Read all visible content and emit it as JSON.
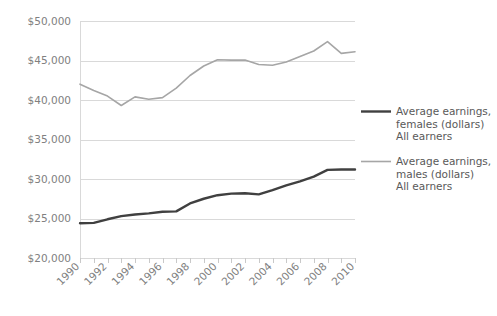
{
  "chart_data": {
    "type": "line",
    "title": "",
    "subtitle": "",
    "xlabel": "",
    "ylabel": "",
    "x": [
      1990,
      1991,
      1992,
      1993,
      1994,
      1995,
      1996,
      1997,
      1998,
      1999,
      2000,
      2001,
      2002,
      2003,
      2004,
      2005,
      2006,
      2007,
      2008,
      2009,
      2010
    ],
    "categories": [
      "1990",
      "1991",
      "1992",
      "1993",
      "1994",
      "1995",
      "1996",
      "1997",
      "1998",
      "1999",
      "2000",
      "2001",
      "2002",
      "2003",
      "2004",
      "2005",
      "2006",
      "2007",
      "2008",
      "2009",
      "2010"
    ],
    "xtick_labels": [
      "1990",
      "1992",
      "1994",
      "1996",
      "1998",
      "2000",
      "2002",
      "2004",
      "2006",
      "2008",
      "2010"
    ],
    "xtick_values": [
      1990,
      1992,
      1994,
      1996,
      1998,
      2000,
      2002,
      2004,
      2006,
      2008,
      2010
    ],
    "xlim": [
      1990,
      2010
    ],
    "ylim": [
      20000,
      50000
    ],
    "ytick_values": [
      20000,
      25000,
      30000,
      35000,
      40000,
      45000,
      50000
    ],
    "ytick_labels": [
      "$20,000",
      "$25,000",
      "$30,000",
      "$35,000",
      "$40,000",
      "$45,000",
      "$50,000"
    ],
    "grid": true,
    "legend_position": "right",
    "series": [
      {
        "name": "Average earnings, females (dollars) All earners",
        "legend_line1": "Average earnings,",
        "legend_line2": "females (dollars)",
        "legend_line3": "All earners",
        "color": "#404040",
        "width": 2.4,
        "values": [
          24400,
          24450,
          24900,
          25300,
          25500,
          25650,
          25850,
          25900,
          26900,
          27500,
          27950,
          28150,
          28200,
          28050,
          28600,
          29200,
          29700,
          30300,
          31150,
          31200,
          31200
        ]
      },
      {
        "name": "Average earnings, males (dollars) All earners",
        "legend_line1": "Average earnings,",
        "legend_line2": "males (dollars)",
        "legend_line3": "All earners",
        "color": "#a6a6a6",
        "width": 1.6,
        "values": [
          42000,
          41200,
          40500,
          39300,
          40400,
          40100,
          40300,
          41500,
          43100,
          44300,
          45100,
          45050,
          45050,
          44500,
          44400,
          44800,
          45500,
          46200,
          47400,
          45900,
          46100
        ]
      }
    ]
  },
  "legend": {
    "entries": [
      {
        "line1": "Average earnings,",
        "line2": "females (dollars)",
        "line3": "All earners",
        "color": "#404040"
      },
      {
        "line1": "Average earnings,",
        "line2": "males (dollars)",
        "line3": "All earners",
        "color": "#a6a6a6"
      }
    ]
  },
  "colors": {
    "females": "#404040",
    "males": "#a6a6a6",
    "grid": "#d9d9d9",
    "axis_text": "#808080",
    "legend_text": "#595959",
    "background": "#ffffff"
  }
}
